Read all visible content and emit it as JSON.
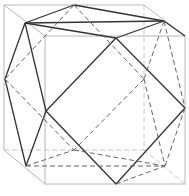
{
  "figure": {
    "type": "cube-with-inscribed-cuboctahedron",
    "colors": {
      "background": "#ffffff",
      "cube_edges": "#b8b8b8",
      "visible_edges": "#333333",
      "hidden_edges": "#666666"
    }
  }
}
